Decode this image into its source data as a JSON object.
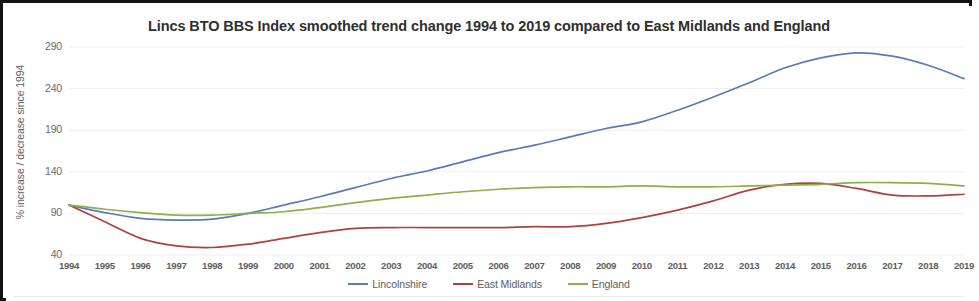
{
  "chart_data": {
    "type": "line",
    "title": "Lincs BTO BBS Index smoothed trend change 1994 to 2019 compared to East Midlands and England",
    "xlabel": "",
    "ylabel": "% increase / decrease since 1994",
    "ylim": [
      40,
      290
    ],
    "yticks": [
      290,
      240,
      190,
      140,
      90,
      40
    ],
    "grid": "horizontal",
    "legend_position": "bottom",
    "categories": [
      "1994",
      "1995",
      "1996",
      "1997",
      "1998",
      "1999",
      "2000",
      "2001",
      "2002",
      "2003",
      "2004",
      "2005",
      "2006",
      "2007",
      "2008",
      "2009",
      "2010",
      "2011",
      "2012",
      "2013",
      "2014",
      "2015",
      "2016",
      "2017",
      "2018",
      "2019"
    ],
    "series": [
      {
        "name": "Lincolnshire",
        "color": "#5b7bb4",
        "values": [
          100,
          91,
          84,
          82,
          83,
          90,
          100,
          110,
          121,
          132,
          141,
          152,
          163,
          172,
          182,
          192,
          200,
          214,
          230,
          247,
          265,
          277,
          283,
          279,
          268,
          252
        ]
      },
      {
        "name": "East Midlands",
        "color": "#b0413e",
        "values": [
          100,
          80,
          60,
          51,
          49,
          53,
          60,
          67,
          72,
          73,
          73,
          73,
          73,
          74,
          74,
          78,
          85,
          94,
          105,
          118,
          125,
          126,
          120,
          112,
          111,
          113
        ]
      },
      {
        "name": "England",
        "color": "#8cb04b",
        "values": [
          100,
          95,
          91,
          88,
          88,
          90,
          92,
          97,
          103,
          108,
          112,
          116,
          119,
          121,
          122,
          122,
          123,
          122,
          122,
          123,
          124,
          125,
          127,
          127,
          126,
          123
        ]
      }
    ]
  },
  "legend": {
    "items": [
      {
        "label": "Lincolnshire",
        "color": "#5b7bb4"
      },
      {
        "label": "East Midlands",
        "color": "#b0413e"
      },
      {
        "label": "England",
        "color": "#8cb04b"
      }
    ]
  }
}
